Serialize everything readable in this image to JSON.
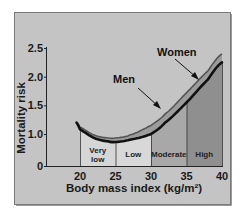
{
  "chart_data": {
    "type": "line",
    "title": "",
    "xlabel": "Body mass index (kg/m²)",
    "ylabel": "Mortality risk",
    "x_ticks": [
      "20",
      "25",
      "30",
      "35",
      "40"
    ],
    "y_ticks": [
      "0",
      "1.0",
      "1.5",
      "2.0",
      "2.5"
    ],
    "xlim": [
      19.5,
      40
    ],
    "ylim": [
      0,
      2.5
    ],
    "y_axis_break": "between 0 and 1.0",
    "grid": false,
    "legend": "inline labels with arrows",
    "x": [
      19.5,
      20,
      22,
      24,
      25,
      27,
      30,
      32,
      35,
      38,
      40
    ],
    "series": [
      {
        "name": "Men",
        "values": [
          1.2,
          1.08,
          0.93,
          0.87,
          0.86,
          0.9,
          1.0,
          1.2,
          1.55,
          1.95,
          2.25
        ],
        "color": "#111111"
      },
      {
        "name": "Women",
        "values": [
          1.2,
          1.12,
          0.98,
          0.93,
          0.93,
          0.98,
          1.15,
          1.35,
          1.72,
          2.1,
          2.4
        ],
        "color": "#8a8a8a"
      }
    ],
    "zones": [
      {
        "label_lines": [
          "Very",
          "low"
        ],
        "label": "Very low",
        "from": 20,
        "to": 25,
        "color": "#d6d6d6"
      },
      {
        "label_lines": [
          "Low"
        ],
        "label": "Low",
        "from": 25,
        "to": 30,
        "color": "#d8d8d8"
      },
      {
        "label_lines": [
          "Moderate"
        ],
        "label": "Moderate",
        "from": 30,
        "to": 35,
        "color": "#a8a8a8"
      },
      {
        "label_lines": [
          "High"
        ],
        "label": "High",
        "from": 35,
        "to": 40,
        "color": "#8f8f8f"
      }
    ],
    "annotations": [
      {
        "text": "Men",
        "target_x": 30.5
      },
      {
        "text": "Women",
        "target_x": 37
      }
    ],
    "panel_background": "#c4c4c4"
  }
}
